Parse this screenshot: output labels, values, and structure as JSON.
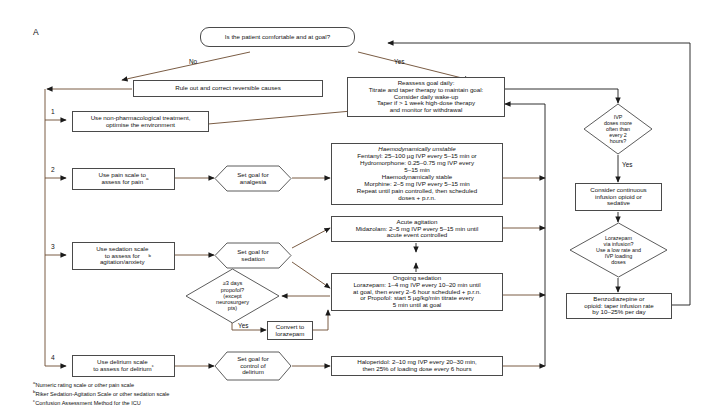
{
  "panel": {
    "letter": "A"
  },
  "nodes": {
    "top_decision": "Is the patient comfortable and at goal?",
    "rule_out": "Rule out and correct reversible causes",
    "non_pharm": "Use non-pharmacological treatment,\noptimise the environment",
    "reassess": "Reassess goal daily:\nTitrate and taper therapy to maintain goal:\nConsider daily wake-up\nTaper if > 1 week high-dose therapy\nand monitor for withdrawal",
    "pain_scale": "Use pain scale to\nassess for pain",
    "pain_scale_sup": "a",
    "goal_analgesia": "Set goal for\nanalgesia",
    "analgesia_head1": "Haemodynamically unstable",
    "analgesia_body1": "Fentanyl: 25–100 µg IVP every 5–15 min or\nHydromorphone: 0.25–0.75 mg IVP every\n5–15 min",
    "analgesia_head2": "Haemodynamically stable",
    "analgesia_body2": "Morphine: 2–5 mg IVP every 5–15 min\nRepeat until pain controlled, then scheduled\ndoses + p.r.n.",
    "sedation_scale": "Use sedation scale\nto assess for\nagitation/anxiety",
    "sedation_scale_sup": "b",
    "goal_sedation": "Set goal for\nsedation",
    "acute_agitation": "Acute agitation\nMidazolam: 2–5 mg IVP every 5–15 min until\nacute event controlled",
    "ongoing_sedation": "Ongoing sedation\nLorazepam: 1–4 mg IVP every 10–20 min until\nat goal, then every 2–6 hour scheduled + p.r.n.\nor Propofol: start 5 µg/kg/min titrate every\n5 min until at goal",
    "propofol_decision": "≥3 days\npropofol?\n(except\nneurosurgery\npts)",
    "convert_lorazepam": "Convert to\nlorazepam",
    "delirium_scale": "Use delirium scale\nto assess for delirium",
    "delirium_scale_sup": "c",
    "goal_delirium": "Set goal for\ncontrol of\ndelirium",
    "haloperidol": "Haloperidol: 2–10 mg IVP every 20–30 min,\nthen 25% of loading dose every 6 hours",
    "ivp_decision": "IVP\ndoses more\noften than\nevery 2\nhours?",
    "continuous_infusion": "Consider continuous\ninfusion opioid or\nsedative",
    "lorazepam_infusion": "Lorazepam\nvia infusion?\nUse a low rate and\nIVP loading\ndoses",
    "taper_infusion": "Benzodiazepine or\nopioid: taper infusion rate\nby 10–25% per day"
  },
  "edge_labels": {
    "no": "No",
    "yes_top": "Yes",
    "yes_propofol": "Yes",
    "yes_ivp": "Yes"
  },
  "row_numbers": {
    "one": "1",
    "two": "2",
    "three": "3",
    "four": "4"
  },
  "footnotes": [
    "Numeric rating scale or other pain scale",
    "Riker Sedation-Agitation Scale or other sedation scale",
    "Confusion Assessment Method for the ICU"
  ],
  "footnote_markers": [
    "a",
    "b",
    "c"
  ],
  "colors": {
    "line_brown": "#6b4a2f",
    "line_black": "#1a1a1a",
    "box_border": "#4a4a4a",
    "text": "#111111",
    "background": "#ffffff"
  }
}
